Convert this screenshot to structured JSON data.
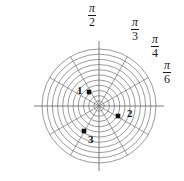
{
  "figure": {
    "type": "polar-grid-plot",
    "width": 184,
    "height": 181,
    "background_color": "#ffffff",
    "grid_color": "#7a7a7a",
    "axis_color": "#6e6e6e",
    "point_color": "#111111",
    "label_color": "#1a1a1a"
  },
  "angle_labels": [
    {
      "name": "pi-over-2",
      "numerator": "π",
      "denominator": "2",
      "angle_deg": 90,
      "x": 88,
      "y": 3
    },
    {
      "name": "pi-over-3",
      "numerator": "π",
      "denominator": "3",
      "angle_deg": 60,
      "x": 131,
      "y": 17
    },
    {
      "name": "pi-over-4",
      "numerator": "π",
      "denominator": "4",
      "angle_deg": 45,
      "x": 151,
      "y": 34
    },
    {
      "name": "pi-over-6",
      "numerator": "π",
      "denominator": "6",
      "angle_deg": 30,
      "x": 163,
      "y": 60
    }
  ],
  "data_points": [
    {
      "name": "point-1",
      "label": "1",
      "x": 89,
      "y": 92,
      "label_x": 77,
      "label_y": 85,
      "r_units": 2.2,
      "theta_deg": 122
    },
    {
      "name": "point-2",
      "label": "2",
      "x": 118,
      "y": 116,
      "label_x": 127,
      "label_y": 108,
      "r_units": 2.3,
      "theta_deg": -27
    },
    {
      "name": "point-3",
      "label": "3",
      "x": 84,
      "y": 131,
      "label_x": 88,
      "label_y": 134,
      "r_units": 3.1,
      "theta_deg": -119
    }
  ],
  "chart_data": {
    "type": "scatter",
    "coordinate_system": "polar",
    "title": "",
    "xlabel": "",
    "ylabel": "",
    "center": {
      "x": 99,
      "y": 106
    },
    "max_radius_px": 57,
    "num_circles": 11,
    "num_spokes": 12,
    "spoke_spacing_deg": 30,
    "grid": true,
    "legend": "none",
    "angle_tick_labels": [
      "π/2",
      "π/3",
      "π/4",
      "π/6"
    ],
    "points": [
      {
        "label": "1",
        "r": 2.2,
        "theta": "122°"
      },
      {
        "label": "2",
        "r": 2.3,
        "theta": "-27°"
      },
      {
        "label": "3",
        "r": 3.1,
        "theta": "-119°"
      }
    ]
  }
}
